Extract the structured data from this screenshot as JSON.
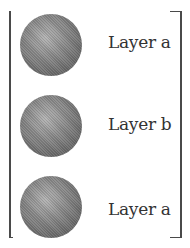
{
  "diagram": {
    "type": "layer-stack",
    "items": [
      {
        "label": "Layer a",
        "shape": "sphere"
      },
      {
        "label": "Layer b",
        "shape": "sphere"
      },
      {
        "label": "Layer a",
        "shape": "sphere"
      }
    ],
    "colors": {
      "sphere": "#8e8e8e",
      "bracket": "#4a4a4a",
      "text": "#333333",
      "background": "#ffffff"
    }
  }
}
